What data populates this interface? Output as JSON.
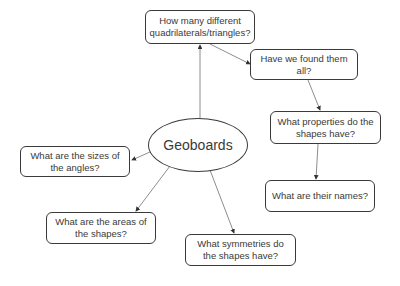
{
  "diagram": {
    "type": "concept-map",
    "center": {
      "label": "Geoboards"
    },
    "nodes": [
      {
        "id": "q1",
        "label": "How many  different quadrilaterals/triangles?"
      },
      {
        "id": "q2",
        "label": "Have we found them all?"
      },
      {
        "id": "q3",
        "label": "What properties do the shapes have?"
      },
      {
        "id": "q4",
        "label": "What are their names?"
      },
      {
        "id": "q5",
        "label": "What are the sizes of the angles?"
      },
      {
        "id": "q6",
        "label": "What are the areas of the shapes?"
      },
      {
        "id": "q7",
        "label": "What symmetries do the shapes have?"
      }
    ],
    "edges": [
      {
        "from": "center",
        "to": "q1"
      },
      {
        "from": "q1",
        "to": "q2"
      },
      {
        "from": "q2",
        "to": "q3"
      },
      {
        "from": "q3",
        "to": "q4"
      },
      {
        "from": "center",
        "to": "q5"
      },
      {
        "from": "center",
        "to": "q6"
      },
      {
        "from": "center",
        "to": "q7"
      }
    ],
    "colors": {
      "stroke": "#3a3a3a",
      "line": "#707070",
      "background": "#ffffff"
    }
  }
}
